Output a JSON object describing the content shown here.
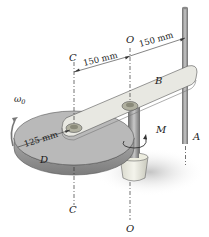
{
  "figure": {
    "type": "mechanism-diagram",
    "labels": {
      "C_top": "C",
      "O_top": "O",
      "B": "B",
      "A": "A",
      "D": "D",
      "M": "M",
      "C_bottom": "C",
      "O_bottom": "O",
      "omega": "ω",
      "omega_sub": "0"
    },
    "dimensions": {
      "C_to_O": "150 mm",
      "O_to_A": "150 mm",
      "disk_radius": "125 mm"
    },
    "colors": {
      "disk_top": "#b9b9b9",
      "disk_edge": "#8f8f8f",
      "arm": "#e6e6e0",
      "shaft": "#9a9a9a",
      "shadow": "#d0d0d0",
      "ink": "#1a1a1a"
    }
  }
}
